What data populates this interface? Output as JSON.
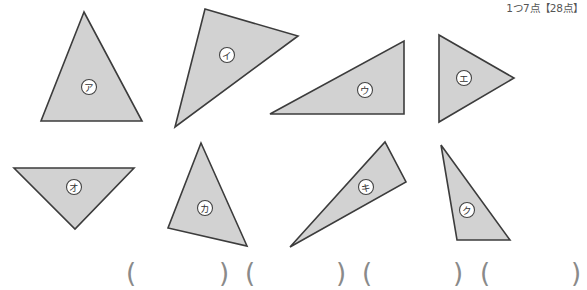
{
  "header": {
    "score_text": "1つ7点【28点】"
  },
  "figures": [
    {
      "id": "a",
      "label": "ア",
      "row": "top"
    },
    {
      "id": "i",
      "label": "イ",
      "row": "top"
    },
    {
      "id": "u",
      "label": "ウ",
      "row": "top"
    },
    {
      "id": "e",
      "label": "エ",
      "row": "top"
    },
    {
      "id": "o",
      "label": "オ",
      "row": "bottom"
    },
    {
      "id": "ka",
      "label": "カ",
      "row": "bottom"
    },
    {
      "id": "ki",
      "label": "キ",
      "row": "bottom"
    },
    {
      "id": "ku",
      "label": "ク",
      "row": "bottom"
    }
  ],
  "answers": [
    {
      "open": "(",
      "value": "",
      "close": ")"
    },
    {
      "open": "(",
      "value": "",
      "close": ")"
    },
    {
      "open": "(",
      "value": "",
      "close": ")"
    },
    {
      "open": "(",
      "value": "",
      "close": ")"
    }
  ],
  "colors": {
    "triangle_fill": "#d2d2d2",
    "triangle_stroke": "#3c3c3c",
    "paren": "#8a8a8a"
  }
}
